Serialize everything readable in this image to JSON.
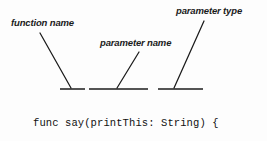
{
  "diagram": {
    "background_color": "#fdfdfd",
    "line_color": "#1b1b1b",
    "text_color": "#111111",
    "annotations": [
      {
        "id": "function-name",
        "label": "function name",
        "leader_from": [
          40,
          33
        ],
        "leader_to": [
          71,
          88
        ],
        "underline_x": [
          60,
          85
        ],
        "underline_y": 89
      },
      {
        "id": "parameter-name",
        "label": "parameter name",
        "leader_from": [
          139,
          52
        ],
        "leader_to": [
          117,
          88
        ],
        "underline_x": [
          89,
          148
        ],
        "underline_y": 89
      },
      {
        "id": "parameter-type",
        "label": "parameter type",
        "leader_from": [
          204,
          21
        ],
        "leader_to": [
          174,
          88
        ],
        "underline_x": [
          158,
          203
        ],
        "underline_y": 89
      }
    ],
    "code": {
      "language": "swift",
      "lines": [
        "func say(printThis: String) {",
        "print(printThis)",
        "}"
      ]
    }
  }
}
